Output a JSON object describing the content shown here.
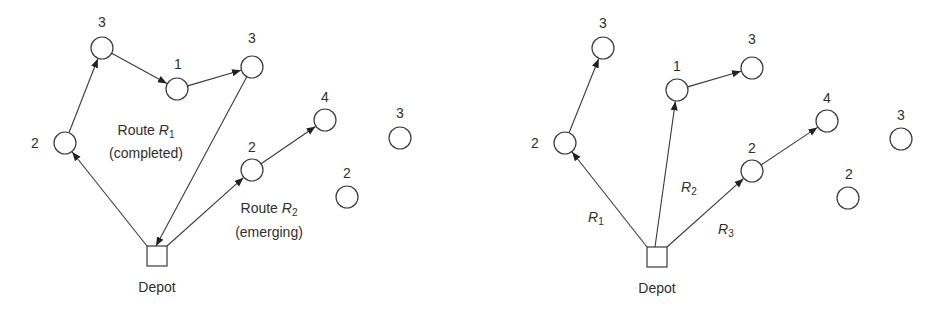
{
  "diagrams": [
    {
      "id": "left",
      "depot": {
        "x": 147,
        "y": 246,
        "size": 20,
        "label": "Depot",
        "label_x": 157,
        "label_y": 292
      },
      "nodes": [
        {
          "id": "a",
          "x": 65,
          "y": 143,
          "demand": "2",
          "lx": 35,
          "ly": 148
        },
        {
          "id": "b",
          "x": 102,
          "y": 48,
          "demand": "3",
          "lx": 102,
          "ly": 27
        },
        {
          "id": "c",
          "x": 177,
          "y": 89,
          "demand": "1",
          "lx": 178,
          "ly": 69
        },
        {
          "id": "d",
          "x": 252,
          "y": 67,
          "demand": "3",
          "lx": 252,
          "ly": 43
        },
        {
          "id": "e",
          "x": 325,
          "y": 120,
          "demand": "4",
          "lx": 325,
          "ly": 102
        },
        {
          "id": "f",
          "x": 252,
          "y": 170,
          "demand": "2",
          "lx": 252,
          "ly": 152
        },
        {
          "id": "g",
          "x": 400,
          "y": 138,
          "demand": "3",
          "lx": 400,
          "ly": 118
        },
        {
          "id": "h",
          "x": 347,
          "y": 197,
          "demand": "2",
          "lx": 347,
          "ly": 178
        }
      ],
      "edges": [
        {
          "from": [
            147,
            246
          ],
          "to": "a"
        },
        {
          "from": "a",
          "to": "b"
        },
        {
          "from": "b",
          "to": "c"
        },
        {
          "from": "c",
          "to": "d"
        },
        {
          "from": "d",
          "to_point": [
            156,
            246
          ]
        },
        {
          "from": [
            167,
            246
          ],
          "to": "f"
        },
        {
          "from": "f",
          "to": "e"
        }
      ],
      "annotations": [
        {
          "line1_prefix": "Route ",
          "line1_var": "R",
          "line1_sub": "1",
          "line2": "(completed)",
          "x": 146,
          "y1": 135,
          "y2": 158
        },
        {
          "line1_prefix": "Route ",
          "line1_var": "R",
          "line1_sub": "2",
          "line2": "(emerging)",
          "x": 269,
          "y1": 213,
          "y2": 237
        }
      ]
    },
    {
      "id": "right",
      "depot": {
        "x": 647,
        "y": 247,
        "size": 20,
        "label": "Depot",
        "label_x": 657,
        "label_y": 293
      },
      "nodes": [
        {
          "id": "a",
          "x": 565,
          "y": 143,
          "demand": "2",
          "lx": 535,
          "ly": 148
        },
        {
          "id": "b",
          "x": 603,
          "y": 48,
          "demand": "3",
          "lx": 603,
          "ly": 28
        },
        {
          "id": "c",
          "x": 677,
          "y": 90,
          "demand": "1",
          "lx": 677,
          "ly": 71
        },
        {
          "id": "d",
          "x": 752,
          "y": 68,
          "demand": "3",
          "lx": 752,
          "ly": 44
        },
        {
          "id": "e",
          "x": 827,
          "y": 121,
          "demand": "4",
          "lx": 827,
          "ly": 103
        },
        {
          "id": "f",
          "x": 752,
          "y": 171,
          "demand": "2",
          "lx": 752,
          "ly": 153
        },
        {
          "id": "g",
          "x": 901,
          "y": 139,
          "demand": "3",
          "lx": 901,
          "ly": 120
        },
        {
          "id": "h",
          "x": 848,
          "y": 198,
          "demand": "2",
          "lx": 849,
          "ly": 179
        }
      ],
      "edges": [
        {
          "from": [
            647,
            247
          ],
          "to": "a"
        },
        {
          "from": "a",
          "to": "b"
        },
        {
          "from": [
            655,
            247
          ],
          "to": "c"
        },
        {
          "from": "c",
          "to": "d"
        },
        {
          "from": [
            667,
            247
          ],
          "to": "f"
        },
        {
          "from": "f",
          "to": "e"
        }
      ],
      "route_labels": [
        {
          "var": "R",
          "sub": "1",
          "x": 588,
          "y": 222
        },
        {
          "var": "R",
          "sub": "2",
          "x": 681,
          "y": 192
        },
        {
          "var": "R",
          "sub": "3",
          "x": 718,
          "y": 234
        }
      ]
    }
  ],
  "style": {
    "stroke": "#3a3a3a",
    "text": "#2f2f2f",
    "background": "#ffffff",
    "node_radius": 11
  }
}
